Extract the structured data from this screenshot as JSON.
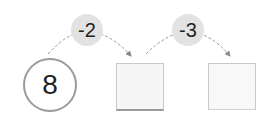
{
  "diagram": {
    "start_value": "8",
    "steps": [
      {
        "operation": "-2",
        "result": ""
      },
      {
        "operation": "-3",
        "result": ""
      }
    ]
  }
}
